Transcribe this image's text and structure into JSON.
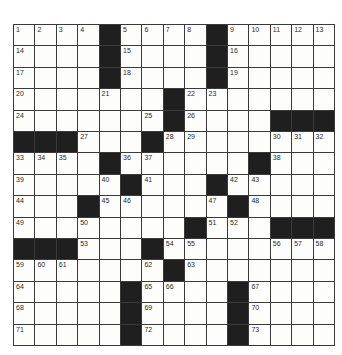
{
  "puzzle": {
    "rows": 15,
    "cols": 15,
    "colors": {
      "block": "#1f1f1f",
      "cell": "#fdfdfc",
      "line": "#3a3a3a"
    },
    "layout": [
      "....#....#.....",
      "....#....#.....",
      "....#....#.....",
      ".......#.......",
      ".......#....###",
      "###....#.......",
      "....#......#...",
      ".....#...#.....",
      "...#......#....",
      ".........#.###",
      "###...#........",
      ".......#.......",
      ".....#....#....",
      ".....#....#....",
      ".....#....#...."
    ],
    "numbers": [
      [
        1,
        2,
        3,
        4,
        0,
        5,
        6,
        7,
        8,
        0,
        9,
        10,
        11,
        12,
        13
      ],
      [
        14,
        0,
        0,
        0,
        0,
        15,
        0,
        0,
        0,
        0,
        16,
        0,
        0,
        0,
        0
      ],
      [
        17,
        0,
        0,
        0,
        0,
        18,
        0,
        0,
        0,
        0,
        19,
        0,
        0,
        0,
        0
      ],
      [
        20,
        0,
        0,
        0,
        21,
        0,
        0,
        0,
        22,
        23,
        0,
        0,
        0,
        0,
        0
      ],
      [
        24,
        0,
        0,
        0,
        0,
        0,
        25,
        0,
        26,
        0,
        0,
        0,
        0,
        0,
        0
      ],
      [
        0,
        0,
        0,
        27,
        0,
        0,
        0,
        28,
        29,
        0,
        0,
        0,
        30,
        31,
        32
      ],
      [
        33,
        34,
        35,
        0,
        0,
        36,
        37,
        0,
        0,
        0,
        0,
        0,
        38,
        0,
        0
      ],
      [
        39,
        0,
        0,
        0,
        40,
        0,
        41,
        0,
        0,
        0,
        42,
        43,
        0,
        0,
        0
      ],
      [
        44,
        0,
        0,
        0,
        45,
        46,
        0,
        0,
        0,
        47,
        0,
        48,
        0,
        0,
        0
      ],
      [
        49,
        0,
        0,
        50,
        0,
        0,
        0,
        0,
        0,
        51,
        52,
        0,
        0,
        0,
        0
      ],
      [
        0,
        0,
        0,
        53,
        0,
        0,
        0,
        54,
        55,
        0,
        0,
        0,
        56,
        57,
        58
      ],
      [
        59,
        60,
        61,
        0,
        0,
        0,
        62,
        0,
        63,
        0,
        0,
        0,
        0,
        0,
        0
      ],
      [
        64,
        0,
        0,
        0,
        0,
        0,
        65,
        66,
        0,
        0,
        0,
        67,
        0,
        0,
        0
      ],
      [
        68,
        0,
        0,
        0,
        0,
        0,
        69,
        0,
        0,
        0,
        0,
        70,
        0,
        0,
        0
      ],
      [
        71,
        0,
        0,
        0,
        0,
        0,
        72,
        0,
        0,
        0,
        0,
        73,
        0,
        0,
        0
      ]
    ]
  }
}
